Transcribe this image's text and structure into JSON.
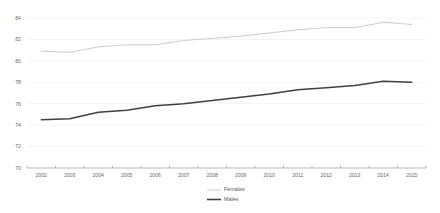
{
  "chart_data": {
    "type": "line",
    "title": "",
    "subtitle": "",
    "xlabel": "",
    "ylabel": "",
    "x": [
      2002,
      2003,
      2004,
      2005,
      2006,
      2007,
      2008,
      2009,
      2010,
      2011,
      2012,
      2013,
      2014,
      2015
    ],
    "categories": [
      "2002",
      "2003",
      "2004",
      "2005",
      "2006",
      "2007",
      "2008",
      "2009",
      "2010",
      "2011",
      "2012",
      "2013",
      "2014",
      "2015"
    ],
    "series": [
      {
        "name": "Females",
        "color": "#c9c9c9",
        "values": [
          80.9,
          80.8,
          81.3,
          81.5,
          81.5,
          81.9,
          82.1,
          82.3,
          82.6,
          82.9,
          83.1,
          83.1,
          83.6,
          83.4
        ]
      },
      {
        "name": "Males",
        "color": "#404040",
        "values": [
          74.5,
          74.6,
          75.2,
          75.4,
          75.8,
          76.0,
          76.3,
          76.6,
          76.9,
          77.3,
          77.5,
          77.7,
          78.1,
          78.0
        ]
      }
    ],
    "ylim": [
      70,
      84
    ],
    "yticks": [
      70,
      72,
      74,
      76,
      78,
      80,
      82,
      84
    ],
    "ytick_labels": [
      "70",
      "72",
      "74",
      "76",
      "78",
      "80",
      "82",
      "84"
    ],
    "grid": true,
    "grid_axis": "y",
    "legend_position": "bottom",
    "legend": [
      {
        "label": "Females",
        "color": "#c9c9c9",
        "width": 0.9
      },
      {
        "label": "Males",
        "color": "#404040",
        "width": 1.6
      }
    ],
    "background": "#ffffff",
    "axis_color": "#9a9a9a",
    "grid_color": "#e9e9e9",
    "tick_text_color": "#6b6b6b"
  }
}
